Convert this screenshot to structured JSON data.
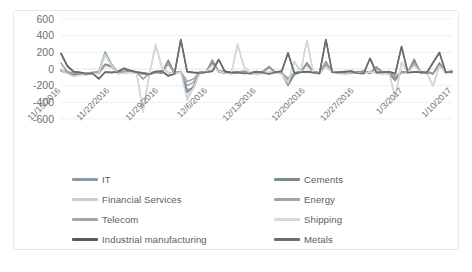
{
  "chart_data": {
    "type": "line",
    "title": "",
    "xlabel": "",
    "ylabel": "",
    "ylim": [
      -600,
      600
    ],
    "yticks": [
      600,
      400,
      200,
      0,
      -200,
      -400,
      -600
    ],
    "ytick_labels": [
      "600",
      "400",
      "200",
      "0",
      "-200",
      "-400",
      "-600"
    ],
    "grid": true,
    "legend_position": "bottom",
    "xtick_labels": [
      "11/15/2016",
      "11/22/2016",
      "11/29/2016",
      "12/6/2016",
      "12/13/2016",
      "12/20/2016",
      "12/27/2016",
      "1/3/2017",
      "1/10/2017"
    ],
    "xtick_rotation": 45,
    "x_points": 63,
    "series": [
      {
        "name": "IT",
        "color": "#8a9ba8",
        "values": [
          70,
          -35,
          -60,
          -55,
          -70,
          -45,
          -30,
          205,
          60,
          -40,
          -25,
          -15,
          -35,
          -120,
          -55,
          -30,
          -45,
          95,
          -60,
          -30,
          -250,
          -230,
          -40,
          -35,
          110,
          -30,
          -20,
          -50,
          -45,
          -35,
          -60,
          -45,
          -35,
          30,
          -45,
          -55,
          -200,
          -70,
          -40,
          75,
          -30,
          -45,
          90,
          -35,
          -40,
          -60,
          -50,
          -40,
          -30,
          -55,
          20,
          -45,
          -60,
          -140,
          -35,
          -40,
          120,
          -45,
          -35,
          -60,
          75,
          -40,
          -30
        ]
      },
      {
        "name": "Financial Services",
        "color": "#c7cdd1",
        "values": [
          -20,
          -40,
          -80,
          -70,
          -60,
          -55,
          -40,
          180,
          40,
          -55,
          -40,
          -30,
          -45,
          -500,
          -70,
          280,
          20,
          -40,
          -55,
          -30,
          -350,
          -200,
          -45,
          -30,
          60,
          -25,
          -40,
          -55,
          295,
          30,
          -45,
          -60,
          -50,
          -35,
          -40,
          -55,
          -160,
          90,
          -30,
          345,
          -40,
          -55,
          40,
          -30,
          -45,
          -60,
          -35,
          -40,
          -55,
          -30,
          -45,
          -60,
          -35,
          -340,
          85,
          -40,
          50,
          -35,
          -45,
          -200,
          40,
          -30,
          -45
        ]
      },
      {
        "name": "Telecom",
        "color": "#9fa8ad",
        "values": [
          -10,
          -30,
          -50,
          -45,
          -55,
          -40,
          -35,
          60,
          30,
          -45,
          -35,
          -25,
          -40,
          -60,
          -50,
          -35,
          -45,
          70,
          -40,
          -30,
          -150,
          -120,
          -35,
          -30,
          85,
          -20,
          -35,
          -45,
          -40,
          -25,
          -50,
          -40,
          -30,
          20,
          -35,
          -45,
          -110,
          -50,
          -30,
          60,
          -35,
          -40,
          55,
          -30,
          -35,
          -50,
          -40,
          -35,
          -25,
          -45,
          15,
          -35,
          -50,
          -90,
          -30,
          -35,
          95,
          -40,
          -30,
          -50,
          55,
          -35,
          -25
        ]
      },
      {
        "name": "Industrial manufacturing",
        "color": "#595959",
        "values": [
          190,
          40,
          -30,
          -40,
          -55,
          -50,
          -120,
          -35,
          -40,
          -30,
          10,
          -20,
          -35,
          -45,
          -60,
          -30,
          -25,
          -80,
          -55,
          355,
          -30,
          -40,
          -45,
          -35,
          -25,
          115,
          -30,
          -40,
          -35,
          -50,
          -45,
          -30,
          -40,
          -55,
          -35,
          -25,
          195,
          -45,
          -35,
          -30,
          -40,
          -50,
          355,
          -35,
          -40,
          -30,
          -25,
          -45,
          -50,
          130,
          -40,
          -35,
          -30,
          -55,
          270,
          -40,
          -35,
          -30,
          -45,
          80,
          200,
          -35,
          -30
        ]
      },
      {
        "name": "Cements",
        "color": "#7b8a92",
        "values": [
          -15,
          -45,
          -70,
          -65,
          -50,
          -60,
          -45,
          55,
          35,
          -50,
          -45,
          -35,
          -50,
          -55,
          -65,
          -40,
          -50,
          105,
          -45,
          -35,
          -280,
          -210,
          -40,
          -35,
          75,
          -30,
          -45,
          -50,
          -45,
          -30,
          -55,
          -45,
          -35,
          25,
          -40,
          -50,
          -180,
          -60,
          -35,
          70,
          -40,
          -50,
          45,
          -35,
          -40,
          -55,
          -45,
          -35,
          -30,
          -50,
          25,
          -40,
          -55,
          -120,
          -40,
          -45,
          100,
          -50,
          -40,
          -55,
          65,
          -45,
          -35
        ]
      },
      {
        "name": "Energy",
        "color": "#a3a3a3",
        "values": [
          -25,
          -50,
          -55,
          -60,
          -45,
          -50,
          -55,
          45,
          25,
          -40,
          -50,
          -40,
          -45,
          -50,
          -60,
          -45,
          -40,
          60,
          -50,
          -40,
          -200,
          -160,
          -45,
          -40,
          55,
          -35,
          -50,
          -45,
          -40,
          -35,
          -50,
          -40,
          -45,
          15,
          -45,
          -40,
          -130,
          -55,
          -40,
          50,
          -45,
          -40,
          35,
          -40,
          -45,
          -50,
          -40,
          -45,
          -35,
          -40,
          10,
          -45,
          -40,
          -100,
          -45,
          -40,
          70,
          -45,
          -40,
          -60,
          45,
          -40,
          -30
        ]
      },
      {
        "name": "Shipping",
        "color": "#d4d8db",
        "values": [
          -5,
          -55,
          -90,
          -75,
          -65,
          -60,
          -50,
          160,
          45,
          -60,
          -50,
          -40,
          -55,
          -520,
          -80,
          300,
          15,
          -50,
          -60,
          -35,
          -380,
          -230,
          -50,
          -35,
          45,
          -30,
          -45,
          -60,
          300,
          25,
          -50,
          -65,
          -55,
          -40,
          -45,
          -60,
          -170,
          80,
          -35,
          340,
          -45,
          -60,
          30,
          -35,
          -50,
          -65,
          -40,
          -45,
          -60,
          -35,
          -50,
          -65,
          -40,
          -350,
          75,
          -45,
          40,
          -40,
          -50,
          -210,
          35,
          -35,
          -50
        ]
      },
      {
        "name": "Metals",
        "color": "#6e6e6e",
        "values": [
          180,
          30,
          -35,
          -45,
          -60,
          -55,
          -115,
          -40,
          -45,
          -35,
          5,
          -25,
          -40,
          -50,
          -65,
          -35,
          -30,
          -85,
          -60,
          350,
          -35,
          -45,
          -50,
          -40,
          -30,
          110,
          -35,
          -45,
          -40,
          -55,
          -50,
          -35,
          -45,
          -60,
          -40,
          -30,
          190,
          -50,
          -40,
          -35,
          -45,
          -55,
          350,
          -40,
          -45,
          -35,
          -30,
          -50,
          -55,
          125,
          -45,
          -40,
          -35,
          -60,
          265,
          -45,
          -40,
          -35,
          -50,
          75,
          195,
          -40,
          -35
        ]
      }
    ]
  }
}
